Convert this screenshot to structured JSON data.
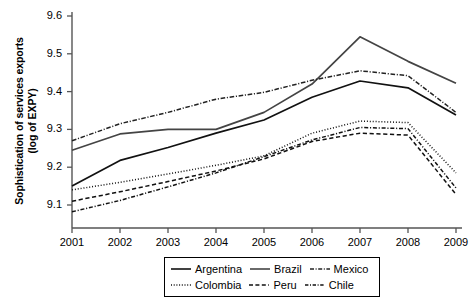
{
  "chart_data": {
    "type": "line",
    "title": "",
    "xlabel": "",
    "ylabel": "Sophistication of services exports (log of EXPY)",
    "ylabel_line1": "Sophistication of services exports",
    "ylabel_line2": "(log of EXPY)",
    "categories": [
      "2001",
      "2002",
      "2003",
      "2004",
      "2005",
      "2006",
      "2007",
      "2008",
      "2009"
    ],
    "x": [
      2001,
      2002,
      2003,
      2004,
      2005,
      2006,
      2007,
      2008,
      2009
    ],
    "ylim": [
      9.05,
      9.62
    ],
    "yticks": [
      9.1,
      9.2,
      9.3,
      9.4,
      9.5,
      9.6
    ],
    "ytick_labels": [
      "9.1",
      "9.2",
      "9.3",
      "9.4",
      "9.5",
      "9.6"
    ],
    "grid": false,
    "legend_position": "bottom",
    "series": [
      {
        "name": "Argentina",
        "style": "solid",
        "color": "#111111",
        "values": [
          9.15,
          9.218,
          9.252,
          9.29,
          9.325,
          9.385,
          9.428,
          9.41,
          9.338
        ]
      },
      {
        "name": "Brazil",
        "style": "solid",
        "color": "#444444",
        "values": [
          9.245,
          9.288,
          9.3,
          9.3,
          9.345,
          9.42,
          9.545,
          9.48,
          9.422
        ]
      },
      {
        "name": "Mexico",
        "style": "dashdot-fine",
        "color": "#222222",
        "values": [
          9.27,
          9.315,
          9.345,
          9.38,
          9.398,
          9.43,
          9.455,
          9.442,
          9.345
        ]
      },
      {
        "name": "Colombia",
        "style": "dotted",
        "color": "#111111",
        "values": [
          9.14,
          9.16,
          9.182,
          9.205,
          9.23,
          9.29,
          9.322,
          9.318,
          9.185
        ]
      },
      {
        "name": "Peru",
        "style": "dashed",
        "color": "#111111",
        "values": [
          9.11,
          9.135,
          9.162,
          9.19,
          9.222,
          9.268,
          9.29,
          9.285,
          9.128
        ]
      },
      {
        "name": "Chile",
        "style": "dashdot",
        "color": "#111111",
        "values": [
          9.082,
          9.112,
          9.148,
          9.185,
          9.228,
          9.272,
          9.305,
          9.302,
          9.145
        ]
      }
    ]
  },
  "legend": {
    "rows": [
      [
        {
          "label": "Argentina",
          "style": "solid"
        },
        {
          "label": "Brazil",
          "style": "solid"
        },
        {
          "label": "Mexico",
          "style": "dashdot-fine"
        }
      ],
      [
        {
          "label": "Colombia",
          "style": "dotted"
        },
        {
          "label": "Peru",
          "style": "dashed"
        },
        {
          "label": "Chile",
          "style": "dashdot"
        }
      ]
    ]
  }
}
